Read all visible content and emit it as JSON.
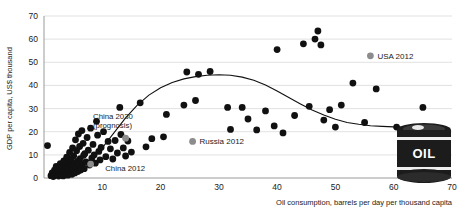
{
  "chart_data": {
    "type": "scatter",
    "title": "",
    "xlabel": "Oil consumption, barrels per day per thousand capita",
    "ylabel": "GDP per capita, US$ thousand",
    "xlim": [
      0,
      70
    ],
    "ylim": [
      0,
      70
    ],
    "xticks": [
      10,
      20,
      30,
      40,
      50,
      60,
      70
    ],
    "yticks": [
      0,
      10,
      20,
      30,
      40,
      50,
      60,
      70
    ],
    "grid": "horizontal",
    "legend_position": "inside-right",
    "marker_color_default": "#111111",
    "marker_color_highlight": "#8c8c8c",
    "trend_line_color": "#111111",
    "grid_color": "#d9d9d9",
    "axis_color": "#9a9a9a",
    "series": [
      {
        "name": "Countries",
        "marker": "filled-circle",
        "color": "#111111",
        "points": [
          [
            0.6,
            14.0
          ],
          [
            1.2,
            1.0
          ],
          [
            1.4,
            2.2
          ],
          [
            1.6,
            0.6
          ],
          [
            1.8,
            3.4
          ],
          [
            2.0,
            1.4
          ],
          [
            2.1,
            5.0
          ],
          [
            2.3,
            2.0
          ],
          [
            2.5,
            0.8
          ],
          [
            2.6,
            3.0
          ],
          [
            2.8,
            6.2
          ],
          [
            2.9,
            1.6
          ],
          [
            3.0,
            4.2
          ],
          [
            3.1,
            2.6
          ],
          [
            3.3,
            0.9
          ],
          [
            3.4,
            7.4
          ],
          [
            3.5,
            3.6
          ],
          [
            3.6,
            1.8
          ],
          [
            3.7,
            5.4
          ],
          [
            3.8,
            2.4
          ],
          [
            3.9,
            9.0
          ],
          [
            4.0,
            4.6
          ],
          [
            4.1,
            1.2
          ],
          [
            4.2,
            6.8
          ],
          [
            4.3,
            3.2
          ],
          [
            4.4,
            11.0
          ],
          [
            4.5,
            2.0
          ],
          [
            4.6,
            8.0
          ],
          [
            4.7,
            5.0
          ],
          [
            4.8,
            1.6
          ],
          [
            4.9,
            13.0
          ],
          [
            5.0,
            3.8
          ],
          [
            5.1,
            9.6
          ],
          [
            5.2,
            6.0
          ],
          [
            5.3,
            2.2
          ],
          [
            5.4,
            16.5
          ],
          [
            5.5,
            4.4
          ],
          [
            5.6,
            11.8
          ],
          [
            5.7,
            7.2
          ],
          [
            5.8,
            2.8
          ],
          [
            5.9,
            19.0
          ],
          [
            6.0,
            5.2
          ],
          [
            6.1,
            13.6
          ],
          [
            6.2,
            8.4
          ],
          [
            6.3,
            3.4
          ],
          [
            6.5,
            20.5
          ],
          [
            6.6,
            6.0
          ],
          [
            6.7,
            15.0
          ],
          [
            6.8,
            9.8
          ],
          [
            6.9,
            4.0
          ],
          [
            7.0,
            10.5
          ],
          [
            7.2,
            7.0
          ],
          [
            7.4,
            17.5
          ],
          [
            7.6,
            12.0
          ],
          [
            7.8,
            5.6
          ],
          [
            8.0,
            21.5
          ],
          [
            8.2,
            8.6
          ],
          [
            8.4,
            14.5
          ],
          [
            8.6,
            10.0
          ],
          [
            8.8,
            6.4
          ],
          [
            9.0,
            24.5
          ],
          [
            9.2,
            18.5
          ],
          [
            9.4,
            11.5
          ],
          [
            9.6,
            7.8
          ],
          [
            9.8,
            13.2
          ],
          [
            10.2,
            20.0
          ],
          [
            10.6,
            9.2
          ],
          [
            11.0,
            15.8
          ],
          [
            11.4,
            12.6
          ],
          [
            11.8,
            8.2
          ],
          [
            12.2,
            16.2
          ],
          [
            12.6,
            10.8
          ],
          [
            13.0,
            30.5
          ],
          [
            13.2,
            18.8
          ],
          [
            13.6,
            13.0
          ],
          [
            14.0,
            9.5
          ],
          [
            14.4,
            16.0
          ],
          [
            15.0,
            11.2
          ],
          [
            16.5,
            32.5
          ],
          [
            17.5,
            13.5
          ],
          [
            18.5,
            17.0
          ],
          [
            20.5,
            17.8
          ],
          [
            21.0,
            27.5
          ],
          [
            24.0,
            31.5
          ],
          [
            24.5,
            45.8
          ],
          [
            26.0,
            33.5
          ],
          [
            26.5,
            44.8
          ],
          [
            28.5,
            46.0
          ],
          [
            31.5,
            30.5
          ],
          [
            32.0,
            21.0
          ],
          [
            34.0,
            30.5
          ],
          [
            35.0,
            25.5
          ],
          [
            36.5,
            20.8
          ],
          [
            38.0,
            29.0
          ],
          [
            39.5,
            22.5
          ],
          [
            40.0,
            55.5
          ],
          [
            41.0,
            19.5
          ],
          [
            43.0,
            27.0
          ],
          [
            44.5,
            58.0
          ],
          [
            45.5,
            31.0
          ],
          [
            46.5,
            60.0
          ],
          [
            47.0,
            63.5
          ],
          [
            47.5,
            57.5
          ],
          [
            48.0,
            25.0
          ],
          [
            49.0,
            29.5
          ],
          [
            50.0,
            22.0
          ],
          [
            51.0,
            31.5
          ],
          [
            53.0,
            41.0
          ],
          [
            55.0,
            24.0
          ],
          [
            57.0,
            38.5
          ],
          [
            60.5,
            22.0
          ],
          [
            65.0,
            30.5
          ]
        ]
      },
      {
        "name": "Highlighted",
        "marker": "filled-circle",
        "color": "#8c8c8c",
        "points": [
          [
            8.0,
            6.0
          ],
          [
            14.0,
            17.2
          ]
        ]
      }
    ],
    "trend_line": {
      "name": "Trend",
      "points": [
        [
          4.0,
          2.0
        ],
        [
          6.0,
          4.5
        ],
        [
          8.0,
          8.0
        ],
        [
          10.0,
          13.0
        ],
        [
          12.0,
          19.5
        ],
        [
          14.0,
          26.0
        ],
        [
          16.0,
          31.5
        ],
        [
          18.0,
          35.8
        ],
        [
          20.0,
          39.0
        ],
        [
          22.0,
          41.3
        ],
        [
          24.0,
          42.8
        ],
        [
          26.0,
          43.8
        ],
        [
          28.0,
          44.4
        ],
        [
          30.0,
          44.6
        ],
        [
          32.0,
          44.4
        ],
        [
          34.0,
          43.6
        ],
        [
          36.0,
          42.2
        ],
        [
          38.0,
          40.2
        ],
        [
          40.0,
          37.6
        ],
        [
          42.0,
          34.8
        ],
        [
          44.0,
          32.0
        ],
        [
          46.0,
          29.4
        ],
        [
          48.0,
          27.2
        ],
        [
          50.0,
          25.4
        ],
        [
          52.0,
          24.0
        ],
        [
          54.0,
          23.2
        ],
        [
          56.0,
          22.6
        ],
        [
          58.0,
          22.3
        ],
        [
          60.0,
          22.1
        ],
        [
          62.0,
          22.0
        ]
      ]
    },
    "annotations": [
      {
        "id": "china-2030",
        "line1": "China 2030",
        "line2": "(prognosis)",
        "x": 8.4,
        "y": 25.5
      },
      {
        "id": "china-2012",
        "line1": "China 2012",
        "line2": "",
        "x": 10.5,
        "y": 3.0
      }
    ],
    "legend": [
      {
        "id": "usa-2012",
        "label": "USA 2012",
        "color": "#8c8c8c",
        "x": 56.0,
        "y": 51.5
      },
      {
        "id": "russia-2012",
        "label": "Russia 2012",
        "color": "#8c8c8c",
        "x": 25.5,
        "y": 14.5
      }
    ],
    "decoration": {
      "id": "oil-barrel",
      "label": "OIL",
      "body_color": "#1c1c1c",
      "band_color": "#f2f2f2"
    }
  }
}
